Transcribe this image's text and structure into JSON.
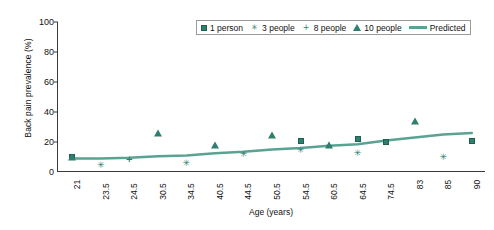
{
  "chart_data": {
    "type": "scatter",
    "title": "",
    "xlabel": "Age (years)",
    "ylabel": "Back pain prevalence (%)",
    "categories": [
      "21",
      "23.5",
      "24.5",
      "30.5",
      "34.5",
      "40.5",
      "44.5",
      "50.5",
      "54.5",
      "60.5",
      "64.5",
      "74.5",
      "83",
      "85",
      "90"
    ],
    "ylim": [
      0,
      100
    ],
    "yticks": [
      0,
      20,
      40,
      60,
      80,
      100
    ],
    "grid": false,
    "legend_position": "top-center",
    "series": [
      {
        "name": "1 person",
        "marker": "square",
        "points": [
          {
            "x": "21",
            "y": 10
          },
          {
            "x": "54.5",
            "y": 21
          },
          {
            "x": "64.5",
            "y": 22
          },
          {
            "x": "74.5",
            "y": 20
          },
          {
            "x": "90",
            "y": 21
          }
        ]
      },
      {
        "name": "3 people",
        "marker": "star",
        "points": [
          {
            "x": "23.5",
            "y": 5
          },
          {
            "x": "34.5",
            "y": 6
          },
          {
            "x": "44.5",
            "y": 12
          },
          {
            "x": "54.5",
            "y": 15
          },
          {
            "x": "64.5",
            "y": 13
          },
          {
            "x": "85",
            "y": 10
          }
        ]
      },
      {
        "name": "8 people",
        "marker": "plus",
        "points": [
          {
            "x": "24.5",
            "y": 9
          },
          {
            "x": "60.5",
            "y": 18
          }
        ]
      },
      {
        "name": "10 people",
        "marker": "triangle",
        "points": [
          {
            "x": "21",
            "y": 10
          },
          {
            "x": "30.5",
            "y": 26
          },
          {
            "x": "40.5",
            "y": 18
          },
          {
            "x": "50.5",
            "y": 25
          },
          {
            "x": "60.5",
            "y": 18
          },
          {
            "x": "83",
            "y": 34
          }
        ]
      }
    ],
    "predicted": {
      "name": "Predicted",
      "values": [
        9,
        9,
        9.5,
        10.5,
        11,
        12.5,
        13.5,
        15,
        16,
        17.5,
        18.5,
        21,
        23,
        25,
        26
      ]
    }
  },
  "legend": {
    "entries": [
      {
        "label": "1 person",
        "glyph": "square-marker"
      },
      {
        "label": "3 people",
        "glyph": "star-marker"
      },
      {
        "label": "8 people",
        "glyph": "plus-marker"
      },
      {
        "label": "10 people",
        "glyph": "triangle-marker"
      },
      {
        "label": "Predicted",
        "glyph": "line-swatch"
      }
    ]
  },
  "colors": {
    "series": "#2f7f6f",
    "predicted_line": "#5aa393",
    "axis": "#3a3a3a"
  }
}
